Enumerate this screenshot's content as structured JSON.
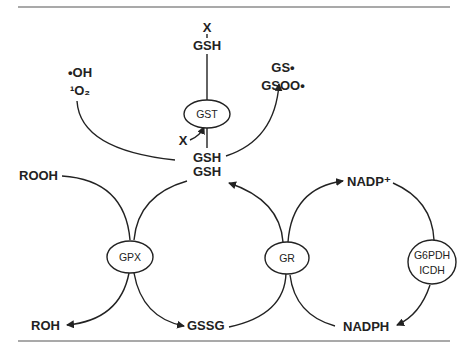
{
  "labels": {
    "x_top": "X",
    "gsh_top": "GSH",
    "oh_radical": "•OH",
    "singlet_oxygen": "¹O₂",
    "gs_radical": "GS•",
    "gsoo_radical": "GSOO•",
    "x_side": "X",
    "gsh_1": "GSH",
    "gsh_2": "GSH",
    "rooh": "ROOH",
    "roh": "ROH",
    "gssg": "GSSG",
    "nadp_plus": "NADP⁺",
    "nadph": "NADPH"
  },
  "enzymes": {
    "gst": "GST",
    "gpx": "GPX",
    "gr": "GR",
    "g6pdh": "G6PDH",
    "icdh": "ICDH"
  }
}
